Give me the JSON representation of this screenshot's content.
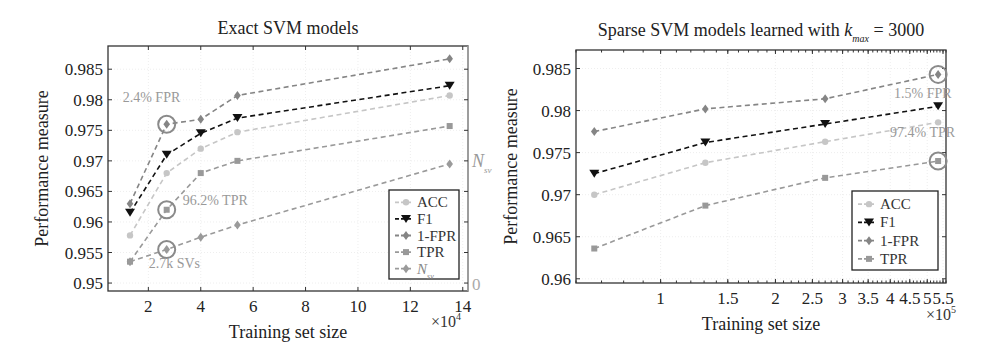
{
  "colors": {
    "acc": "#c6c6c6",
    "f1": "#111111",
    "fpr": "#858585",
    "tpr": "#999999",
    "nsv": "#9a9a9a",
    "annotation": "#8a8a8a",
    "axis": "#333333",
    "grid": "#eeeeee"
  },
  "chart_data": [
    {
      "type": "line",
      "title": "Exact SVM models",
      "xlabel": "Training set size",
      "x_multiplier": "×10^4",
      "ylabel": "Performance measure",
      "right_ylabel": "N_sv",
      "right_ytick": "0",
      "xscale": "linear",
      "xlim": [
        0.46,
        14.2
      ],
      "ylim": [
        0.9487,
        0.9888
      ],
      "xticks": [
        2,
        4,
        6,
        8,
        10,
        12,
        14
      ],
      "xtick_labels": [
        "2",
        "4",
        "6",
        "8",
        "10",
        "12",
        "14"
      ],
      "yticks": [
        0.95,
        0.955,
        0.96,
        0.965,
        0.97,
        0.975,
        0.98,
        0.985
      ],
      "ytick_labels": [
        "0.95",
        "0.955",
        "0.96",
        "0.965",
        "0.97",
        "0.975",
        "0.98",
        "0.985"
      ],
      "grid": true,
      "legend_position": "lower right",
      "x": [
        1.3,
        2.7,
        4.0,
        5.4,
        13.5
      ],
      "series": [
        {
          "name": "ACC",
          "key": "acc",
          "marker": "circle",
          "values": [
            0.9578,
            0.968,
            0.972,
            0.9747,
            0.9807
          ]
        },
        {
          "name": "F1",
          "key": "f1",
          "marker": "triangle-down",
          "values": [
            0.9615,
            0.971,
            0.9745,
            0.977,
            0.9823
          ]
        },
        {
          "name": "1-FPR",
          "key": "fpr",
          "marker": "diamond",
          "values": [
            0.963,
            0.976,
            0.9768,
            0.9807,
            0.9867
          ]
        },
        {
          "name": "TPR",
          "key": "tpr",
          "marker": "square",
          "values": [
            0.9535,
            0.962,
            0.968,
            0.97,
            0.9757
          ]
        },
        {
          "name": "N_sv",
          "key": "nsv",
          "marker": "diamond",
          "values": [
            0.9535,
            0.9555,
            0.9575,
            0.9595,
            0.9695
          ]
        }
      ],
      "annotations": [
        {
          "text": "2.4% FPR",
          "x": 2.7,
          "y": 0.976,
          "circle": true,
          "label_dx": -44,
          "label_dy": -22
        },
        {
          "text": "96.2% TPR",
          "x": 2.7,
          "y": 0.962,
          "circle": true,
          "label_dx": 16,
          "label_dy": -5
        },
        {
          "text": "2.7k SVs",
          "x": 2.7,
          "y": 0.9555,
          "circle": true,
          "label_dx": -18,
          "label_dy": 19
        }
      ]
    },
    {
      "type": "line",
      "title": "Sparse SVM models learned with k_max = 3000",
      "title_main": "Sparse SVM models learned with ",
      "title_k": "k",
      "title_sub": "max",
      "title_tail": " = 3000",
      "xlabel": "Training set size",
      "x_multiplier": "×10^5",
      "ylabel": "Performance measure",
      "xscale": "log",
      "xlim": [
        0.6,
        5.6
      ],
      "ylim": [
        0.9595,
        0.9872
      ],
      "xticks": [
        1,
        1.5,
        2,
        2.5,
        3,
        3.5,
        4,
        4.5,
        5,
        5.5
      ],
      "xtick_labels": [
        "1",
        "1.5",
        "2",
        "2.5",
        "3",
        "3.5",
        "4",
        "4.5",
        "5",
        "5.5"
      ],
      "yticks": [
        0.96,
        0.965,
        0.97,
        0.975,
        0.98,
        0.985
      ],
      "ytick_labels": [
        "0.96",
        "0.965",
        "0.97",
        "0.975",
        "0.98",
        "0.985"
      ],
      "grid": true,
      "legend_position": "lower right",
      "x": [
        0.67,
        1.31,
        2.7,
        5.34
      ],
      "series": [
        {
          "name": "ACC",
          "key": "acc",
          "marker": "circle",
          "values": [
            0.97,
            0.9738,
            0.9763,
            0.9786
          ]
        },
        {
          "name": "F1",
          "key": "f1",
          "marker": "triangle-down",
          "values": [
            0.9725,
            0.9762,
            0.9784,
            0.9805
          ]
        },
        {
          "name": "1-FPR",
          "key": "fpr",
          "marker": "diamond",
          "values": [
            0.9775,
            0.9802,
            0.9814,
            0.9843
          ]
        },
        {
          "name": "TPR",
          "key": "tpr",
          "marker": "square",
          "values": [
            0.9636,
            0.9687,
            0.972,
            0.974
          ]
        }
      ],
      "annotations": [
        {
          "text": "1.5% FPR",
          "x": 5.34,
          "y": 0.9843,
          "circle": true,
          "label_dx": -44,
          "label_dy": 24
        },
        {
          "text": "97.4% TPR",
          "x": 5.34,
          "y": 0.974,
          "circle": true,
          "label_dx": -48,
          "label_dy": -24
        }
      ]
    }
  ],
  "layout": [
    {
      "left": 108,
      "top": 46,
      "right": 468,
      "bottom": 291,
      "legend": {
        "x": 389,
        "y": 190,
        "w": 70,
        "h": 89
      },
      "title_y": 34,
      "xlabel_y": 338,
      "ylabel_x": 48,
      "mult_x": 461,
      "mult_y": 327
    },
    {
      "left": 576,
      "top": 50,
      "right": 946,
      "bottom": 283,
      "legend": {
        "x": 852,
        "y": 191,
        "w": 86,
        "h": 79
      },
      "title_y": 36,
      "xlabel_y": 330,
      "ylabel_x": 517,
      "mult_x": 956,
      "mult_y": 320
    }
  ]
}
